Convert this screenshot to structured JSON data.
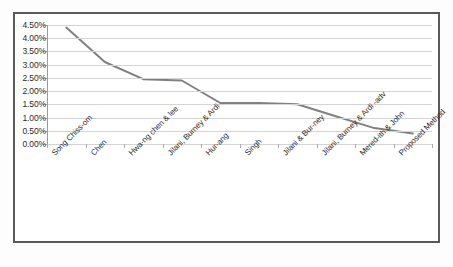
{
  "chart_data": {
    "type": "line",
    "title": "",
    "xlabel": "",
    "ylabel": "",
    "categories": [
      "Song Chiss-om",
      "Chen",
      "Hwa-ng chen & lee",
      "Jilani, Burney & Ardi",
      "Hur-ang",
      "Singh",
      "Jilani & Bur-ney",
      "Jilani, Burney & Ardi -adv",
      "Mered-ith & John",
      "Proposed Method"
    ],
    "values": [
      4.4,
      3.1,
      2.45,
      2.4,
      1.55,
      1.55,
      1.5,
      1.05,
      0.6,
      0.4
    ],
    "value_unit": "%",
    "ylim": [
      0.0,
      4.5
    ],
    "ytick_step": 0.5,
    "ytick_labels": [
      "4.50%",
      "4.00%",
      "3.50%",
      "3.00%",
      "2.50%",
      "2.00%",
      "1.50%",
      "1.00%",
      "0.50%",
      "0.00%"
    ],
    "grid": true,
    "legend": false,
    "legend_position": "none",
    "series": [
      {
        "name": "",
        "color": "#808080",
        "values": [
          4.4,
          3.1,
          2.45,
          2.4,
          1.55,
          1.55,
          1.5,
          1.05,
          0.6,
          0.4
        ]
      }
    ]
  },
  "style": {
    "line_color": "#808080",
    "grid_color": "#d4d4d4",
    "border_color": "#5a5a5a",
    "text_color": "#2b2b2b",
    "plot_background": "#ffffff"
  }
}
